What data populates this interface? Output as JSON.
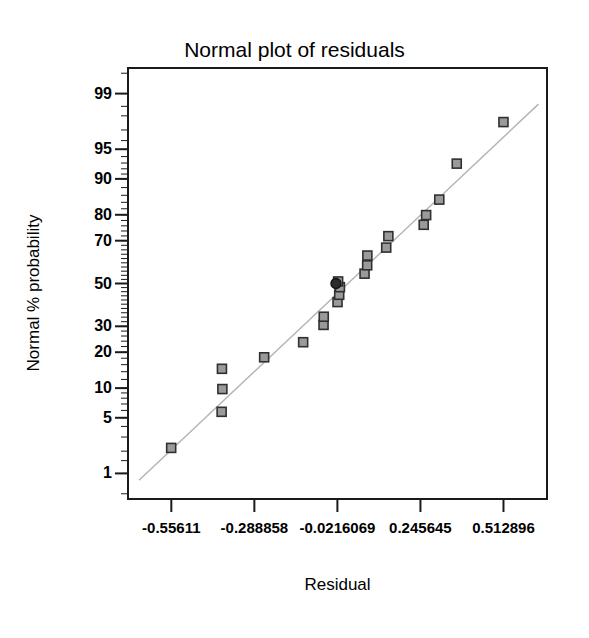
{
  "chart_data": {
    "type": "scatter",
    "title": "Normal plot of residuals",
    "xlabel": "Residual",
    "ylabel": "Normal % probability",
    "grid": false,
    "legend": null,
    "xlim": [
      -0.69874,
      0.656169
    ],
    "ylim_percent": [
      0.4,
      99.6
    ],
    "y_scale": "normal-probability",
    "xticks": [
      -0.55611,
      -0.288858,
      -0.0216069,
      0.245645,
      0.512896
    ],
    "xtick_labels": [
      "-0.55611",
      "-0.288858",
      "-0.0216069",
      "0.245645",
      "0.512896"
    ],
    "yticks": [
      1,
      5,
      10,
      20,
      30,
      50,
      70,
      80,
      90,
      95,
      99
    ],
    "ytick_labels": [
      "1",
      "5",
      "10",
      "20",
      "30",
      "50",
      "70",
      "80",
      "90",
      "95",
      "99"
    ],
    "marker": {
      "shape": "square",
      "fill": "#9a9a9a",
      "edge": "#303030",
      "size_px": 9
    },
    "highlight_marker": {
      "shape": "circle",
      "fill": "#2b2b2b",
      "edge": "#111111",
      "size_px": 10
    },
    "reference_line": {
      "color": "#b4b4b4",
      "width_px": 1.4,
      "x_start": -0.66,
      "x_end": 0.6255,
      "p_start": 0.8,
      "p_end": 98.6
    },
    "points": [
      {
        "residual": -0.5566,
        "probability": 2.2
      },
      {
        "residual": -0.3942,
        "probability": 5.8
      },
      {
        "residual": -0.3918,
        "probability": 9.8
      },
      {
        "residual": -0.3932,
        "probability": 14.8
      },
      {
        "residual": -0.2573,
        "probability": 18.3
      },
      {
        "residual": -0.1318,
        "probability": 23.6
      },
      {
        "residual": -0.0662,
        "probability": 30.6
      },
      {
        "residual": -0.0655,
        "probability": 34.2
      },
      {
        "residual": -0.0212,
        "probability": 41.0
      },
      {
        "residual": -0.0158,
        "probability": 44.5
      },
      {
        "residual": -0.0135,
        "probability": 48.2
      },
      {
        "residual": -0.0193,
        "probability": 51.0
      },
      {
        "residual": 0.0658,
        "probability": 54.8
      },
      {
        "residual": 0.0742,
        "probability": 58.8
      },
      {
        "residual": 0.0748,
        "probability": 63.4
      },
      {
        "residual": 0.1355,
        "probability": 67.0
      },
      {
        "residual": 0.1424,
        "probability": 71.9
      },
      {
        "residual": 0.2562,
        "probability": 76.4
      },
      {
        "residual": 0.264,
        "probability": 79.9
      },
      {
        "residual": 0.3063,
        "probability": 84.8
      },
      {
        "residual": 0.3625,
        "probability": 92.9
      },
      {
        "residual": 0.5128,
        "probability": 97.6
      }
    ],
    "highlight_points": [
      {
        "residual": -0.0262,
        "probability": 50.0
      }
    ]
  }
}
